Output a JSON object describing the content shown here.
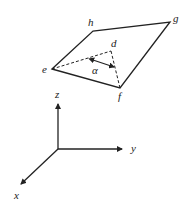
{
  "diagram": {
    "plane": {
      "vertices": [
        {
          "label": "e",
          "x": 52,
          "y": 69
        },
        {
          "label": "f",
          "x": 120,
          "y": 88
        },
        {
          "label": "g",
          "x": 170,
          "y": 22
        },
        {
          "label": "h",
          "x": 93,
          "y": 31
        }
      ]
    },
    "dashed_point": {
      "label": "d",
      "x": 111,
      "y": 51
    },
    "angle": {
      "label": "α"
    },
    "axes": {
      "z": "z",
      "y": "y",
      "x": "x"
    },
    "colors": {
      "line": "#222222",
      "background": "#ffffff"
    }
  }
}
